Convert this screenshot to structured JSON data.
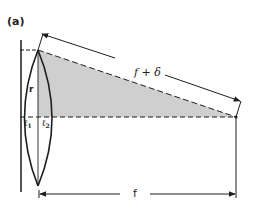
{
  "figure": {
    "panel_label": "(a)",
    "labels": {
      "f_plus_delta": "f + δ",
      "f": "f",
      "r": "r",
      "l1_base": "ℓ",
      "l1_sub": "1",
      "l2_base": "ℓ",
      "l2_sub": "2"
    },
    "colors": {
      "line": "#1e1e1e",
      "shade": "#cfcfcf",
      "plate": "#555555",
      "background": "#ffffff"
    }
  }
}
